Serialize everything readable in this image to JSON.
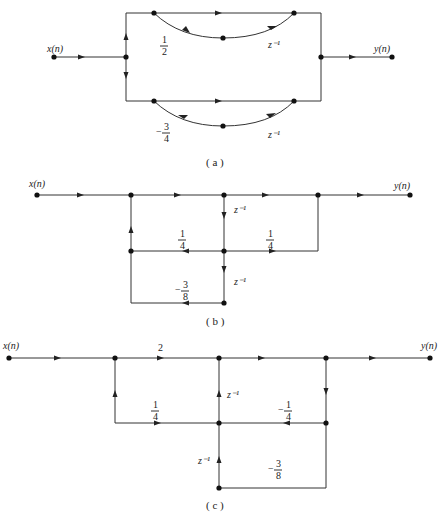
{
  "diagram_a": {
    "caption": "( a )",
    "input_label": "x(n)",
    "output_label": "y(n)",
    "upper_branch": {
      "coefficient": {
        "num": "1",
        "den": "2",
        "sign": ""
      },
      "delay": "z⁻¹"
    },
    "lower_branch": {
      "coefficient": {
        "num": "3",
        "den": "4",
        "sign": "−"
      },
      "delay": "z⁻¹"
    }
  },
  "diagram_b": {
    "caption": "( b )",
    "input_label": "x(n)",
    "output_label": "y(n)",
    "delay_upper": "z⁻¹",
    "delay_lower": "z⁻¹",
    "feedback_coefficient": {
      "num": "1",
      "den": "4",
      "sign": ""
    },
    "feedforward_coefficient": {
      "num": "1",
      "den": "4",
      "sign": ""
    },
    "bottom_coefficient": {
      "num": "3",
      "den": "8",
      "sign": "−"
    }
  },
  "diagram_c": {
    "caption": "( c )",
    "input_label": "x(n)",
    "output_label": "y(n)",
    "gain": "2",
    "delay_upper": "z⁻¹",
    "delay_lower": "z⁻¹",
    "left_coefficient": {
      "num": "1",
      "den": "4",
      "sign": ""
    },
    "right_coefficient": {
      "num": "1",
      "den": "4",
      "sign": "−"
    },
    "bottom_coefficient": {
      "num": "3",
      "den": "8",
      "sign": "−"
    }
  }
}
